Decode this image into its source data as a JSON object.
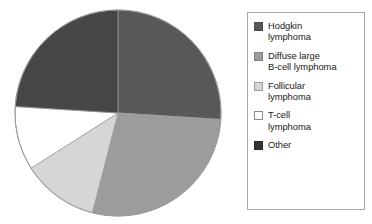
{
  "chart_data": {
    "type": "pie",
    "title": "",
    "subtitle": "",
    "xlabel": "",
    "ylabel": "",
    "grid": false,
    "legend_position": "right",
    "start_angle_deg": 0,
    "direction": "clockwise",
    "categories": [
      "Hodgkin lymphoma",
      "Diffuse large B-cell lymphoma",
      "Follicular lymphoma",
      "T-cell lymphoma",
      "Other"
    ],
    "values": [
      26,
      28,
      12,
      10,
      24
    ],
    "units": "percent",
    "slices": [
      {
        "label": "Hodgkin lymphoma",
        "value": 26,
        "color": "#585858",
        "start_deg": 0,
        "end_deg": 93.6
      },
      {
        "label": "Diffuse large B-cell lymphoma",
        "value": 28,
        "color": "#9c9c9c",
        "start_deg": 93.6,
        "end_deg": 194.4
      },
      {
        "label": "Follicular lymphoma",
        "value": 12,
        "color": "#d6d6d6",
        "start_deg": 194.4,
        "end_deg": 237.6
      },
      {
        "label": "T-cell lymphoma",
        "value": 10,
        "color": "#ffffff",
        "start_deg": 237.6,
        "end_deg": 273.6
      },
      {
        "label": "Other",
        "value": 24,
        "color": "#474747",
        "start_deg": 273.6,
        "end_deg": 360
      }
    ]
  },
  "legend": {
    "border_color": "#a8a8a8",
    "background": "#ffffff",
    "items": [
      {
        "label": "Hodgkin\nlymphoma",
        "swatch_color": "#585858",
        "swatch_border": "#4a4a4a",
        "icon": "legend-swatch-icon"
      },
      {
        "label": "Diffuse large\nB-cell lymphoma",
        "swatch_color": "#9c9c9c",
        "swatch_border": "#818181",
        "icon": "legend-swatch-icon"
      },
      {
        "label": "Follicular\nlymphoma",
        "swatch_color": "#d6d6d6",
        "swatch_border": "#9a9a9a",
        "icon": "legend-swatch-icon"
      },
      {
        "label": "T-cell\nlymphoma",
        "swatch_color": "#ffffff",
        "swatch_border": "#8a8a8a",
        "icon": "legend-swatch-icon"
      },
      {
        "label": "Other",
        "swatch_color": "#333333",
        "swatch_border": "#2b2b2b",
        "icon": "legend-swatch-icon"
      }
    ]
  },
  "pie": {
    "center_x": 104,
    "center_y": 104,
    "radius": 103,
    "outline_color": "#9a9a9a"
  }
}
